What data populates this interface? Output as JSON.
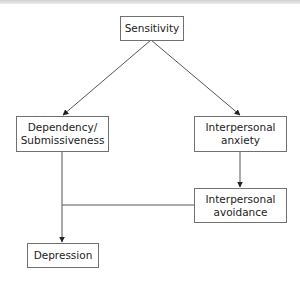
{
  "diagram": {
    "nodes": {
      "sensitivity": {
        "lines": [
          "Sensitivity"
        ]
      },
      "dependency": {
        "lines": [
          "Dependency/",
          "Submissiveness"
        ]
      },
      "anxiety": {
        "lines": [
          "Interpersonal",
          "anxiety"
        ]
      },
      "avoidance": {
        "lines": [
          "Interpersonal",
          "avoidance"
        ]
      },
      "depression": {
        "lines": [
          "Depression"
        ]
      }
    },
    "edges": [
      {
        "from": "Sensitivity",
        "to": "Dependency/Submissiveness"
      },
      {
        "from": "Sensitivity",
        "to": "Interpersonal anxiety"
      },
      {
        "from": "Interpersonal anxiety",
        "to": "Interpersonal avoidance"
      },
      {
        "from": "Dependency/Submissiveness",
        "to": "Depression"
      },
      {
        "from": "Interpersonal avoidance",
        "to": "Depression"
      }
    ],
    "colors": {
      "line": "#555555",
      "border": "#707070",
      "text": "#222222"
    }
  }
}
